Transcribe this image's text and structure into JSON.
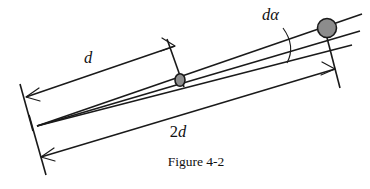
{
  "figure": {
    "caption": "Figure 4-2",
    "labels": {
      "d": "d",
      "two": "2",
      "two_d_suffix": "d",
      "d_alpha_d": "d",
      "d_alpha_alpha": "α"
    },
    "colors": {
      "stroke": "#1a1a1a",
      "disc_fill": "#8c8c8c",
      "background": "#ffffff",
      "text": "#111111"
    },
    "elements": {
      "upper_ray_name": "upper-ray",
      "lower_ray_name": "lower-ray",
      "far_particle_name": "far-particle",
      "near_particle_name": "near-particle",
      "angle_arc_name": "angle-arc",
      "dim_d_name": "dimension-d",
      "dim_2d_name": "dimension-2d"
    }
  }
}
